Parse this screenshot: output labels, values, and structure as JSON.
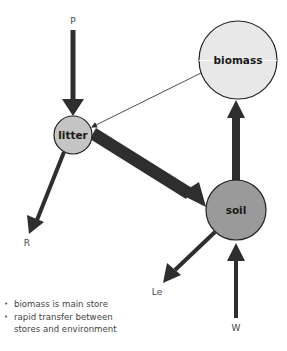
{
  "diagram": {
    "title": "",
    "nodes": [
      {
        "id": "biomass",
        "label": "biomass",
        "cx": 238,
        "cy": 60,
        "r": 39,
        "fill": "#e8e8e8"
      },
      {
        "id": "litter",
        "label": "litter",
        "cx": 73,
        "cy": 135,
        "r": 19,
        "fill": "#c4c4c4"
      },
      {
        "id": "soil",
        "label": "soil",
        "cx": 236,
        "cy": 210,
        "r": 30,
        "fill": "#9a9a9a"
      }
    ],
    "flows": [
      {
        "from": "P",
        "to": "litter",
        "width": "medium"
      },
      {
        "from": "biomass",
        "to": "litter",
        "width": "thin"
      },
      {
        "from": "litter",
        "to": "soil",
        "width": "thick"
      },
      {
        "from": "litter",
        "to": "R",
        "width": "medium"
      },
      {
        "from": "soil",
        "to": "biomass",
        "width": "thick"
      },
      {
        "from": "soil",
        "to": "Le",
        "width": "medium"
      },
      {
        "from": "W",
        "to": "soil",
        "width": "medium"
      }
    ],
    "labels": {
      "P": "P",
      "R": "R",
      "Le": "Le",
      "W": "W"
    },
    "notes": [
      "biomass is main store",
      "rapid transfer between",
      "stores and environment"
    ],
    "colors": {
      "arrow": "#2e2e2e",
      "outline": "#222222"
    }
  }
}
